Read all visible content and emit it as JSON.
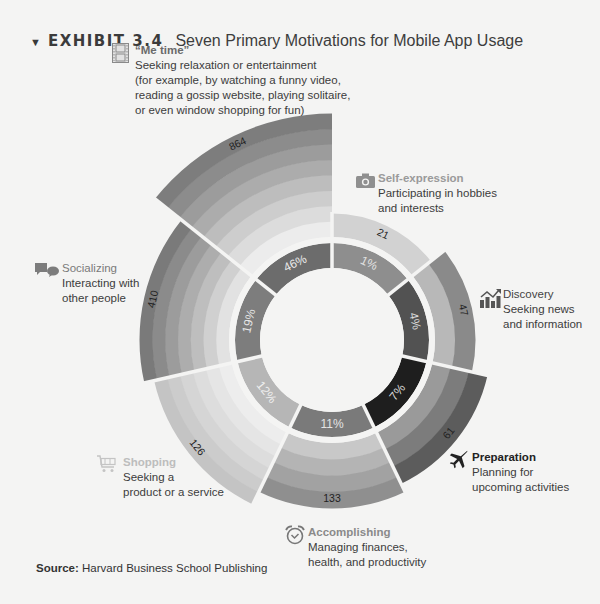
{
  "header": {
    "exhibit": "EXHIBIT 3.4",
    "title": "Seven Primary Motivations for Mobile App Usage"
  },
  "source": {
    "label": "Source:",
    "text": "Harvard Business School Publishing"
  },
  "labels": {
    "me_time": {
      "icon": "film-icon",
      "head": "“Me time”",
      "lines": [
        "Seeking relaxation or entertainment",
        "(for example, by watching a funny video,",
        "reading a gossip website, playing solitaire,",
        "or even window shopping for fun)"
      ]
    },
    "self_expression": {
      "icon": "camera-icon",
      "head": "Self-expression",
      "lines": [
        "Participating in hobbies",
        "and interests"
      ]
    },
    "discovery": {
      "icon": "trend-chart-icon",
      "head": "Discovery",
      "lines": [
        "Seeking news",
        "and information"
      ]
    },
    "preparation": {
      "icon": "airplane-icon",
      "head": "Preparation",
      "lines": [
        "Planning for",
        "upcoming activities"
      ]
    },
    "accomplishing": {
      "icon": "alarm-clock-icon",
      "head": "Accomplishing",
      "lines": [
        "Managing finances,",
        "health, and productivity"
      ]
    },
    "shopping": {
      "icon": "cart-icon",
      "head": "Shopping",
      "lines": [
        "Seeking a",
        "product or a service"
      ]
    },
    "socializing": {
      "icon": "chat-bubbles-icon",
      "head": "Socializing",
      "lines": [
        "Interacting with",
        "other people"
      ]
    }
  },
  "chart_data": {
    "type": "radial-bar-donut",
    "title": "Seven Primary Motivations for Mobile App Usage",
    "categories": [
      "Me time",
      "Self-expression",
      "Discovery",
      "Preparation",
      "Accomplishing",
      "Shopping",
      "Socializing"
    ],
    "series": [
      {
        "name": "Count (outer bars)",
        "values": [
          864,
          21,
          47,
          61,
          133,
          126,
          410
        ]
      },
      {
        "name": "Share (inner donut)",
        "values": [
          "46%",
          "1%",
          "4%",
          "7%",
          "11%",
          "12%",
          "19%"
        ]
      }
    ],
    "descriptions": [
      "Seeking relaxation or entertainment (for example, by watching a funny video, reading a gossip website, playing solitaire, or even window shopping for fun)",
      "Participating in hobbies and interests",
      "Seeking news and information",
      "Planning for upcoming activities",
      "Managing finances, health, and productivity",
      "Seeking a product or a service",
      "Interacting with other people"
    ],
    "source": "Harvard Business School Publishing",
    "grid": false,
    "legend": "inline labels around chart"
  },
  "geometry": {
    "cx": 332,
    "cy": 340,
    "donut_inner": 72,
    "donut_outer": 97,
    "bar_inner": 103,
    "sectors": [
      {
        "key": "me_time",
        "start": -51.43,
        "end": 0,
        "outer": 226,
        "donut": "#6c6c6c",
        "bands": [
          "#ececec",
          "#dcdcdc",
          "#cdcdcd",
          "#bdbdbd",
          "#acacac",
          "#9c9c9c",
          "#8c8c8c",
          "#7d7d7d"
        ],
        "pct_color": "#e8e8e8"
      },
      {
        "key": "self_expression",
        "start": 0,
        "end": 51.43,
        "outer": 126,
        "donut": "#8e8e8e",
        "bands": [
          "#d2d2d2"
        ],
        "pct_color": "#e0e0e0"
      },
      {
        "key": "discovery",
        "start": 51.43,
        "end": 102.86,
        "outer": 143,
        "donut": "#525252",
        "bands": [
          "#b8b8b8",
          "#8a8a8a"
        ],
        "pct_color": "#d8d8d8"
      },
      {
        "key": "preparation",
        "start": 102.86,
        "end": 154.29,
        "outer": 159,
        "donut": "#1e1e1e",
        "bands": [
          "#9a9a9a",
          "#7c7c7c",
          "#5c5c5c"
        ],
        "pct_color": "#dddddd"
      },
      {
        "key": "accomplishing",
        "start": 154.29,
        "end": 205.71,
        "outer": 168,
        "donut": "#7a7a7a",
        "bands": [
          "#c8c8c8",
          "#b4b4b4",
          "#a2a2a2",
          "#8f8f8f"
        ],
        "pct_color": "#e4e4e4"
      },
      {
        "key": "shopping",
        "start": 205.71,
        "end": 257.14,
        "outer": 182,
        "donut": "#b6b6b6",
        "bands": [
          "#ededed",
          "#e5e5e5",
          "#dddddd",
          "#d5d5d5",
          "#cccccc",
          "#c4c4c4"
        ],
        "pct_color": "#efefef"
      },
      {
        "key": "socializing",
        "start": 257.14,
        "end": 308.57,
        "outer": 192,
        "donut": "#7d7d7d",
        "bands": [
          "#e2e2e2",
          "#d0d0d0",
          "#bebebe",
          "#adadad",
          "#9c9c9c",
          "#8b8b8b",
          "#7a7a7a"
        ],
        "pct_color": "#e6e6e6"
      }
    ]
  }
}
